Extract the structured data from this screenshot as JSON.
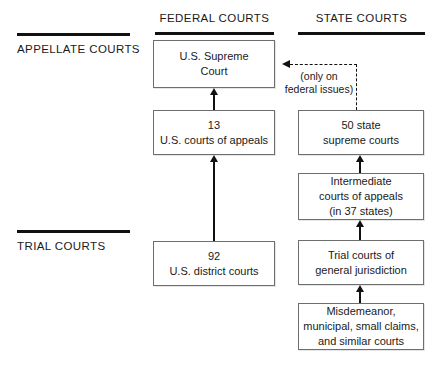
{
  "columns": [
    {
      "id": "federal",
      "label": "FEDERAL COURTS"
    },
    {
      "id": "state",
      "label": "STATE COURTS"
    }
  ],
  "tiers": [
    {
      "id": "appellate",
      "label": "APPELLATE COURTS"
    },
    {
      "id": "trial",
      "label": "TRIAL COURTS"
    }
  ],
  "federal_boxes": [
    {
      "id": "us-supreme-court",
      "text": "U.S. Supreme\nCourt"
    },
    {
      "id": "us-courts-of-appeals",
      "text": "13\nU.S. courts of appeals"
    },
    {
      "id": "us-district-courts",
      "text": "92\nU.S. district courts"
    }
  ],
  "state_boxes": [
    {
      "id": "state-supreme-courts",
      "text": "50 state\nsupreme courts"
    },
    {
      "id": "intermediate-courts-of-appeals",
      "text": "Intermediate\ncourts of appeals\n(in 37 states)"
    },
    {
      "id": "trial-courts-general-jurisdiction",
      "text": "Trial courts of\ngeneral jurisdiction"
    },
    {
      "id": "misdemeanor-municipal-courts",
      "text": "Misdemeanor,\nmunicipal, small claims,\nand similar courts"
    }
  ],
  "annotations": {
    "federal_issues_note": "(only on\nfederal issues)"
  },
  "colors": {
    "rule": "#111111",
    "box_border": "#6e6e6e",
    "arrow": "#111111",
    "text": "#1a1a1a",
    "background": "#ffffff"
  }
}
